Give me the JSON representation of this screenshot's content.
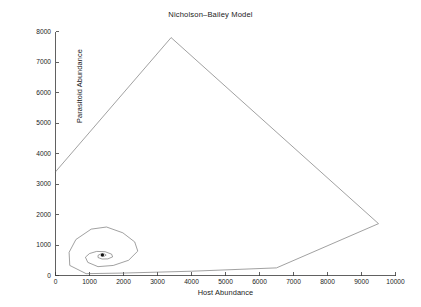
{
  "figure": {
    "background_color": "#ffffff",
    "line_color": "#6d6d6d",
    "axis_color": "#3a3a3a",
    "text_color": "#222222"
  },
  "chart_data": {
    "type": "line",
    "title": "Nicholson–Bailey Model",
    "xlabel": "Host Abundance",
    "ylabel": "Parasitoid Abundance",
    "xlim": [
      0,
      10000
    ],
    "ylim": [
      0,
      8000
    ],
    "grid": false,
    "legend": null,
    "xticks": [
      0,
      1000,
      2000,
      3000,
      4000,
      5000,
      6000,
      7000,
      8000,
      9000,
      10000
    ],
    "xticklabels": [
      "0",
      "1000",
      "2000",
      "3000",
      "4000",
      "5000",
      "6000",
      "7000",
      "8000",
      "9000",
      "10000"
    ],
    "yticks": [
      0,
      1000,
      2000,
      3000,
      4000,
      5000,
      6000,
      7000,
      8000
    ],
    "yticklabels": [
      "0",
      "1000",
      "2000",
      "3000",
      "4000",
      "5000",
      "6000",
      "7000",
      "8000"
    ],
    "series": [
      {
        "name": "trajectory",
        "marker": "none",
        "points": [
          [
            0,
            3400
          ],
          [
            3400,
            7800
          ],
          [
            9500,
            1700
          ],
          [
            6500,
            250
          ],
          [
            4000,
            140
          ],
          [
            2000,
            80
          ],
          [
            900,
            60
          ],
          [
            420,
            330
          ],
          [
            400,
            760
          ],
          [
            600,
            1180
          ],
          [
            1050,
            1520
          ],
          [
            1500,
            1590
          ],
          [
            1980,
            1400
          ],
          [
            2330,
            1100
          ],
          [
            2420,
            800
          ],
          [
            2150,
            500
          ],
          [
            1700,
            330
          ],
          [
            1250,
            290
          ],
          [
            950,
            430
          ],
          [
            880,
            600
          ],
          [
            1000,
            720
          ],
          [
            1210,
            790
          ],
          [
            1460,
            780
          ],
          [
            1650,
            700
          ],
          [
            1680,
            610
          ],
          [
            1540,
            545
          ],
          [
            1370,
            540
          ],
          [
            1250,
            590
          ],
          [
            1250,
            660
          ],
          [
            1330,
            705
          ],
          [
            1440,
            705
          ],
          [
            1490,
            670
          ],
          [
            1440,
            635
          ],
          [
            1370,
            630
          ],
          [
            1330,
            655
          ],
          [
            1355,
            680
          ],
          [
            1400,
            685
          ],
          [
            1410,
            672
          ],
          [
            1385,
            662
          ],
          [
            1365,
            668
          ],
          [
            1372,
            678
          ],
          [
            1388,
            678
          ],
          [
            1390,
            672
          ],
          [
            1378,
            669
          ],
          [
            1373,
            673
          ],
          [
            1380,
            676
          ],
          [
            1384,
            674
          ],
          [
            1380,
            672
          ],
          [
            1377,
            673
          ],
          [
            1380,
            674
          ]
        ]
      }
    ],
    "annotations": [
      {
        "kind": "fixed-point",
        "x": 1380,
        "y": 674,
        "label": "equilibrium"
      }
    ]
  }
}
